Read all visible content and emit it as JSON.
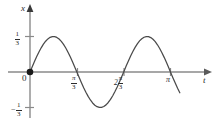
{
  "figure": {
    "background_color": "#ffffff",
    "axis_color": "#8a8a8a",
    "curve_color": "#4a4a4a",
    "text_color": "#2b2b2b",
    "origin_dot_color": "#1a1a1a"
  },
  "axes": {
    "x_axis_label": "x",
    "t_axis_label": "t",
    "origin_label": "0"
  },
  "y_ticks": [
    {
      "name": "positive-third",
      "sign": "",
      "numerator": "1",
      "denominator": "3",
      "value": 0.3333
    },
    {
      "name": "negative-third",
      "sign": "−",
      "numerator": "1",
      "denominator": "3",
      "value": -0.3333
    }
  ],
  "x_ticks": [
    {
      "name": "pi-over-3",
      "prefix": "",
      "numerator": "π",
      "denominator": "3",
      "value": 1.0472
    },
    {
      "name": "two-pi-over-3",
      "prefix": "2",
      "numerator": "π",
      "denominator": "3",
      "value": 2.0944
    },
    {
      "name": "pi",
      "prefix": "",
      "numerator": "π",
      "denominator": "",
      "value": 3.1416
    }
  ],
  "chart_data": {
    "type": "line",
    "title": "",
    "xlabel": "t",
    "ylabel": "x",
    "grid": false,
    "legend": false,
    "xlim": [
      -0.18,
      3.72
    ],
    "ylim": [
      -0.46,
      0.52
    ],
    "xtick_values": [
      1.0472,
      2.0944,
      3.1416
    ],
    "xtick_labels": [
      "π/3",
      "2π/3",
      "π"
    ],
    "ytick_values": [
      0.3333,
      -0.3333
    ],
    "ytick_labels": [
      "1/3",
      "-1/3"
    ],
    "function": "x = (1/3)sin(3t)",
    "amplitude": 0.3333,
    "period": 2.0944,
    "markers": [
      {
        "label": "origin",
        "x": 0,
        "y": 0,
        "style": "filled-dot"
      }
    ],
    "annotations": [
      {
        "text": "zero crossing at t = π/3",
        "x": 1.0472,
        "y": 0
      },
      {
        "text": "zero crossing at t = 2π/3",
        "x": 2.0944,
        "y": 0
      },
      {
        "text": "zero crossing at t = π",
        "x": 3.1416,
        "y": 0
      },
      {
        "text": "maximum 1/3 at t = π/6",
        "x": 0.5236,
        "y": 0.3333
      },
      {
        "text": "minimum -1/3 at t = π/2",
        "x": 1.5708,
        "y": -0.3333
      },
      {
        "text": "maximum 1/3 at t = 5π/6",
        "x": 2.618,
        "y": 0.3333
      }
    ],
    "series": [
      {
        "name": "x(t)",
        "x": [
          0.0,
          0.05,
          0.1,
          0.15,
          0.2,
          0.25,
          0.3,
          0.35,
          0.4,
          0.45,
          0.5,
          0.55,
          0.6,
          0.65,
          0.7,
          0.75,
          0.8,
          0.85,
          0.9,
          0.95,
          1.0,
          1.05,
          1.1,
          1.15,
          1.2,
          1.25,
          1.3,
          1.35,
          1.4,
          1.45,
          1.5,
          1.55,
          1.6,
          1.65,
          1.7,
          1.75,
          1.8,
          1.85,
          1.9,
          1.95,
          2.0,
          2.05,
          2.1,
          2.15,
          2.2,
          2.25,
          2.3,
          2.35,
          2.4,
          2.45,
          2.5,
          2.55,
          2.6,
          2.65,
          2.7,
          2.75,
          2.8,
          2.85,
          2.9,
          2.95,
          3.0,
          3.05,
          3.1,
          3.15,
          3.2,
          3.25,
          3.3,
          3.35,
          3.4
        ],
        "y": [
          0.0,
          0.0497,
          0.0985,
          0.1452,
          0.1886,
          0.2279,
          0.2621,
          0.2904,
          0.3124,
          0.3274,
          0.3327,
          0.3327,
          0.3251,
          0.3103,
          0.2888,
          0.2612,
          0.2283,
          0.1911,
          0.1505,
          0.1076,
          0.0635,
          0.0192,
          -0.0242,
          -0.0658,
          -0.1046,
          -0.1399,
          -0.1707,
          -0.1965,
          -0.2167,
          -0.2309,
          -0.3327,
          -0.3308,
          -0.3231,
          -0.308,
          -0.2861,
          -0.258,
          -0.2245,
          -0.1866,
          -0.1454,
          -0.102,
          -0.0575,
          -0.013,
          0.0303,
          0.072,
          0.111,
          0.1466,
          0.1779,
          0.2042,
          0.225,
          0.2398,
          0.3327,
          0.3318,
          0.3248,
          0.3118,
          0.2929,
          0.2686,
          0.2393,
          0.2057,
          0.1684,
          0.1283,
          0.0863,
          0.0432,
          0.0,
          -0.0432,
          -0.0863,
          -0.1283,
          -0.1684,
          -0.2057,
          -0.2393
        ]
      }
    ]
  }
}
